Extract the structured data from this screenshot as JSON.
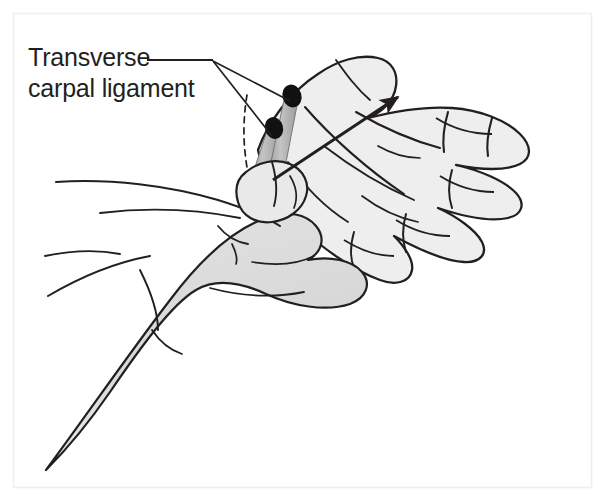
{
  "figure": {
    "name": "carpal-tunnel-compression-test-illustration",
    "type": "medical-line-drawing",
    "background_color": "#ffffff",
    "border_color": "#efefef",
    "ink_color": "#231f20",
    "skin_fill_light": "#eeeeee",
    "skin_fill_mid": "#e0e0e0",
    "skin_fill_dark": "#d4d4d4",
    "tendon_fill": "#b3b3b3",
    "tendon_cap_color": "#111111"
  },
  "annotations": {
    "label": {
      "line1": "Transverse",
      "line2": "carpal ligament",
      "color": "#231f20",
      "font_size_px": 25,
      "x": 28,
      "y_line1": 66,
      "y_line2": 96
    },
    "leader_lines": {
      "name": "leader-lines",
      "origin_x": 213,
      "origin_y": 63,
      "targets": [
        {
          "x": 272,
          "y": 133
        },
        {
          "x": 289,
          "y": 99
        }
      ]
    },
    "direction_arrow": {
      "name": "compression-direction-arrow",
      "from_x": 273,
      "from_y": 180,
      "to_x": 400,
      "to_y": 95,
      "meaning": "direction of applied pressure"
    },
    "dashed_line": {
      "name": "ligament-outline-dashed",
      "points": "247,95 244,110 243,130 244,152 246,170"
    }
  },
  "structures": [
    {
      "name": "patient-hand-palm-up",
      "side": "right",
      "fill": "#eeeeee"
    },
    {
      "name": "patient-fingers",
      "count": 4
    },
    {
      "name": "patient-thumb",
      "count": 1
    },
    {
      "name": "examiner-hand-grasping",
      "fill": "#d8d8d8"
    },
    {
      "name": "examiner-thumb-pressing",
      "fill": "#e6e6e6"
    },
    {
      "name": "examiner-forearm",
      "fill": "#dcdcdc"
    },
    {
      "name": "tendon-cross-section-ulnar",
      "cap_color": "#111111"
    },
    {
      "name": "tendon-cross-section-radial",
      "cap_color": "#111111"
    }
  ]
}
